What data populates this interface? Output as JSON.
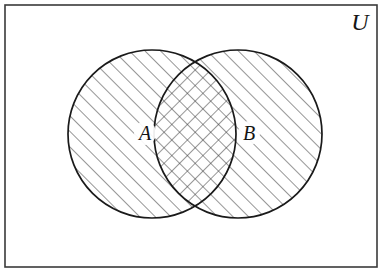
{
  "figure": {
    "type": "venn-diagram",
    "background_color": "#ffffff",
    "line_color": "#1a1a1a",
    "hatch_color": "#4a4a4a"
  },
  "universe": {
    "label": "U",
    "border_color": "#3a3a3a",
    "border_width": 1.6,
    "rect": {
      "x": 5,
      "y": 5,
      "width": 372,
      "height": 262
    },
    "label_position": {
      "x": 360,
      "y": 30
    },
    "label_font_size": 24
  },
  "sets": [
    {
      "id": "A",
      "label": "A",
      "cx": 152,
      "cy": 134,
      "r": 84,
      "hatch": "forward-diagonal",
      "label_position": {
        "x": 145,
        "y": 140
      },
      "label_font_size": 20
    },
    {
      "id": "B",
      "label": "B",
      "cx": 238,
      "cy": 134,
      "r": 84,
      "hatch": "forward-diagonal",
      "label_position": {
        "x": 249,
        "y": 140
      },
      "label_font_size": 20
    }
  ],
  "intersection": {
    "id": "A-and-B",
    "hatch": "cross-hatch",
    "lens_left_x": 155,
    "lens_right_x": 222
  },
  "hatching": {
    "spacing": 11,
    "stroke_width": 1,
    "angle_degrees": 45
  }
}
